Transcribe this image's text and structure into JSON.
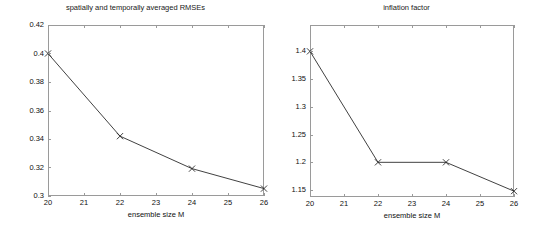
{
  "figure": {
    "width": 542,
    "height": 232,
    "background": "#ffffff",
    "axis_color": "#9a9a9a",
    "line_color": "#2b2b2b"
  },
  "chart_data": [
    {
      "type": "line",
      "panel": "left",
      "title": "spatially and temporally averaged RMSEs",
      "xlabel": "ensemble size M",
      "ylabel": "",
      "x": [
        20,
        22,
        24,
        26
      ],
      "values": [
        0.4,
        0.342,
        0.3192,
        0.3052
      ],
      "xlim": [
        20,
        26
      ],
      "ylim": [
        0.3,
        0.42
      ],
      "xticks": [
        20,
        21,
        22,
        23,
        24,
        25,
        26
      ],
      "xticklabels": [
        "20",
        "21",
        "22",
        "23",
        "24",
        "25",
        "26"
      ],
      "yticks": [
        0.3,
        0.32,
        0.34,
        0.36,
        0.38,
        0.4,
        0.42
      ],
      "yticklabels": [
        "0.3",
        "0.32",
        "0.34",
        "0.36",
        "0.38",
        "0.4",
        "0.42"
      ],
      "marker": "x",
      "grid": false,
      "legend": null
    },
    {
      "type": "line",
      "panel": "right",
      "title": "inflation factor",
      "xlabel": "ensemble size M",
      "ylabel": "",
      "x": [
        20,
        22,
        24,
        26
      ],
      "values": [
        1.4,
        1.2,
        1.2,
        1.148
      ],
      "xlim": [
        20,
        26
      ],
      "ylim": [
        1.1375,
        1.4475
      ],
      "xticks": [
        20,
        21,
        22,
        23,
        24,
        25,
        26
      ],
      "xticklabels": [
        "20",
        "21",
        "22",
        "23",
        "24",
        "25",
        "26"
      ],
      "yticks": [
        1.15,
        1.2,
        1.25,
        1.3,
        1.35,
        1.4
      ],
      "yticklabels": [
        "1.15",
        "1.2",
        "1.25",
        "1.3",
        "1.35",
        "1.4"
      ],
      "marker": "x",
      "grid": false,
      "legend": null
    }
  ],
  "layout": {
    "left_panel": {
      "plot_x": 48,
      "plot_y": 25,
      "plot_w": 216,
      "plot_h": 171
    },
    "right_panel": {
      "plot_x": 39,
      "plot_y": 25,
      "plot_w": 204,
      "plot_h": 172
    }
  }
}
